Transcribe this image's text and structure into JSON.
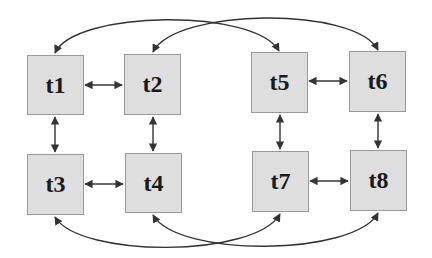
{
  "diagram": {
    "colors": {
      "node_fill": "#dedede",
      "node_border": "#9a9a9a",
      "edge": "#333333",
      "text": "#1a1a1a"
    },
    "nodes": [
      {
        "id": "t1",
        "label": "t1",
        "x": 27,
        "y": 55,
        "w": 57,
        "h": 60
      },
      {
        "id": "t2",
        "label": "t2",
        "x": 124,
        "y": 54,
        "w": 57,
        "h": 61
      },
      {
        "id": "t3",
        "label": "t3",
        "x": 27,
        "y": 154,
        "w": 57,
        "h": 61
      },
      {
        "id": "t4",
        "label": "t4",
        "x": 125,
        "y": 153,
        "w": 57,
        "h": 60
      },
      {
        "id": "t5",
        "label": "t5",
        "x": 251,
        "y": 52,
        "w": 57,
        "h": 61
      },
      {
        "id": "t6",
        "label": "t6",
        "x": 349,
        "y": 51,
        "w": 57,
        "h": 61
      },
      {
        "id": "t7",
        "label": "t7",
        "x": 252,
        "y": 151,
        "w": 57,
        "h": 61
      },
      {
        "id": "t8",
        "label": "t8",
        "x": 350,
        "y": 150,
        "w": 57,
        "h": 61
      }
    ],
    "edges": [
      {
        "from": "t1",
        "to": "t2",
        "type": "bidirectional",
        "shape": "straight"
      },
      {
        "from": "t3",
        "to": "t4",
        "type": "bidirectional",
        "shape": "straight"
      },
      {
        "from": "t1",
        "to": "t3",
        "type": "bidirectional",
        "shape": "straight"
      },
      {
        "from": "t2",
        "to": "t4",
        "type": "bidirectional",
        "shape": "straight"
      },
      {
        "from": "t5",
        "to": "t6",
        "type": "bidirectional",
        "shape": "straight"
      },
      {
        "from": "t7",
        "to": "t8",
        "type": "bidirectional",
        "shape": "straight"
      },
      {
        "from": "t5",
        "to": "t7",
        "type": "bidirectional",
        "shape": "straight"
      },
      {
        "from": "t6",
        "to": "t8",
        "type": "bidirectional",
        "shape": "straight"
      },
      {
        "from": "t1",
        "to": "t5",
        "type": "bidirectional",
        "shape": "curved-top"
      },
      {
        "from": "t2",
        "to": "t6",
        "type": "bidirectional",
        "shape": "curved-top"
      },
      {
        "from": "t3",
        "to": "t7",
        "type": "bidirectional",
        "shape": "curved-bottom"
      },
      {
        "from": "t4",
        "to": "t8",
        "type": "bidirectional",
        "shape": "curved-bottom"
      }
    ]
  }
}
